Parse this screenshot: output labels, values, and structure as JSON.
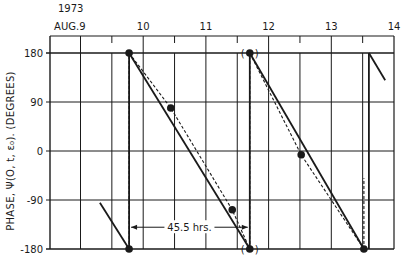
{
  "chart_data": {
    "type": "line",
    "title": "",
    "year_label": "1973",
    "xlabel": "",
    "ylabel": "PHASE, Ψ(O, t, ε₀).   (DEGREES)",
    "x_unit": "day of August 1973",
    "xlim": [
      8.52,
      14.0
    ],
    "ylim": [
      -180,
      180
    ],
    "grid": true,
    "x_ticks": [
      {
        "value": 9,
        "label": "AUG.9"
      },
      {
        "value": 10,
        "label": "10"
      },
      {
        "value": 11,
        "label": "11"
      },
      {
        "value": 12,
        "label": "12"
      },
      {
        "value": 13,
        "label": "13"
      },
      {
        "value": 14,
        "label": "14"
      }
    ],
    "x_minor_grid": [
      8.5,
      9.0,
      9.5,
      10.0,
      10.5,
      11.0,
      11.5,
      12.0,
      12.5,
      13.0,
      13.5
    ],
    "y_ticks": [
      {
        "value": 180,
        "label": "180"
      },
      {
        "value": 90,
        "label": "90"
      },
      {
        "value": 0,
        "label": "0"
      },
      {
        "value": -90,
        "label": "-90"
      },
      {
        "value": -180,
        "label": "-180"
      }
    ],
    "series": [
      {
        "name": "fitted phase (solid)",
        "style": "solid",
        "segments": [
          [
            [
              9.31,
              -95
            ],
            [
              9.775,
              -180
            ]
          ],
          [
            [
              9.775,
              -180
            ],
            [
              9.775,
              180
            ]
          ],
          [
            [
              9.775,
              180
            ],
            [
              11.7,
              -180
            ]
          ],
          [
            [
              11.7,
              -180
            ],
            [
              11.7,
              180
            ]
          ],
          [
            [
              11.7,
              180
            ],
            [
              13.52,
              -180
            ]
          ],
          [
            [
              13.6,
              -180
            ],
            [
              13.6,
              180
            ]
          ],
          [
            [
              13.6,
              180
            ],
            [
              13.86,
              130
            ]
          ]
        ]
      },
      {
        "name": "observed phase trend (dashed)",
        "style": "dashed",
        "segments": [
          [
            [
              9.775,
              -180
            ],
            [
              9.775,
              180
            ]
          ],
          [
            [
              9.775,
              180
            ],
            [
              10.44,
              79
            ],
            [
              11.42,
              -108
            ],
            [
              11.7,
              -180
            ]
          ],
          [
            [
              11.7,
              -180
            ],
            [
              11.7,
              180
            ]
          ],
          [
            [
              11.7,
              180
            ],
            [
              12.52,
              -7
            ],
            [
              13.52,
              -180
            ]
          ],
          [
            [
              13.52,
              -180
            ],
            [
              13.52,
              -50
            ]
          ]
        ]
      },
      {
        "name": "measured points",
        "style": "markers",
        "points": [
          {
            "x": 9.775,
            "y": 180
          },
          {
            "x": 9.775,
            "y": -180
          },
          {
            "x": 10.44,
            "y": 79
          },
          {
            "x": 11.42,
            "y": -108
          },
          {
            "x": 11.7,
            "y": 180,
            "bracketed": true
          },
          {
            "x": 11.7,
            "y": -180,
            "bracketed": true
          },
          {
            "x": 12.52,
            "y": -7
          },
          {
            "x": 13.52,
            "y": -180
          }
        ]
      }
    ],
    "annotations": [
      {
        "text": "45.5 hrs.",
        "type": "period-arrow",
        "x_from": 9.775,
        "x_to": 11.7,
        "y": -140
      }
    ]
  }
}
